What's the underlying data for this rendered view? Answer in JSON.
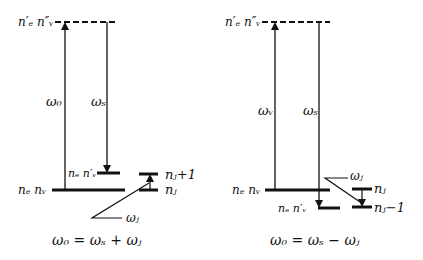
{
  "left_panel": {
    "virtual_level_label": "n′ₑ n″ᵥ",
    "ground_level_label": "nₑ nᵥ",
    "intermediate_level_label": "nₑ n′ᵥ",
    "pump_label": "ω₀",
    "stokes_label": "ωₛ",
    "phonon_upper_label": "nⱼ+1",
    "phonon_lower_label": "nⱼ",
    "phonon_freq_label": "ωⱼ",
    "equation": "ω₀ = ωₛ + ωⱼ"
  },
  "right_panel": {
    "virtual_level_label": "n′ₑ n″ᵥ",
    "ground_level_label": "nₑ nᵥ",
    "intermediate_level_label": "nₑ n′ᵥ",
    "pump_label": "ωᵥ",
    "stokes_label": "ωₛ",
    "phonon_upper_label": "nⱼ",
    "phonon_lower_label": "nⱼ−1",
    "phonon_freq_label": "ωⱼ",
    "equation": "ω₀ = ωₛ − ωⱼ"
  }
}
